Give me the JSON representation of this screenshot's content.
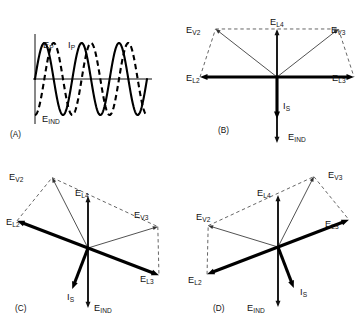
{
  "figure": {
    "width": 362,
    "height": 324,
    "background": "#ffffff",
    "ink": "#000000"
  },
  "panels": [
    {
      "id": "A",
      "tag": "(A)",
      "type": "waveform",
      "description": "Sinusoidal voltage and current waveforms with induced voltage",
      "labels": [
        {
          "base": "E",
          "sub": "P",
          "name": "primary-voltage"
        },
        {
          "base": "I",
          "sub": "P",
          "name": "primary-current"
        },
        {
          "base": "E",
          "sub": "IND",
          "name": "induced-voltage"
        }
      ],
      "waves": [
        {
          "name": "E_P",
          "style": "solid",
          "cycles": 3,
          "phase_deg": 0,
          "amplitude": 36
        },
        {
          "name": "I_P",
          "style": "dashed",
          "cycles": 3,
          "phase_deg": -90,
          "amplitude": 36
        }
      ]
    },
    {
      "id": "B",
      "tag": "(B)",
      "type": "phasor",
      "description": "Balanced phasor diagram, line voltages horizontal",
      "vectors": [
        {
          "label_base": "E",
          "label_sub": "L4",
          "angle_deg": 90,
          "weight": "medium",
          "name": "phasor-el4"
        },
        {
          "label_base": "E",
          "label_sub": "V2",
          "angle_deg": 142,
          "weight": "light",
          "name": "phasor-ev2"
        },
        {
          "label_base": "E",
          "label_sub": "V3",
          "angle_deg": 38,
          "weight": "light",
          "name": "phasor-ev3"
        },
        {
          "label_base": "E",
          "label_sub": "L2",
          "angle_deg": 180,
          "weight": "heavy",
          "name": "phasor-el2"
        },
        {
          "label_base": "E",
          "label_sub": "L3",
          "angle_deg": 0,
          "weight": "heavy",
          "name": "phasor-el3"
        },
        {
          "label_base": "I",
          "label_sub": "S",
          "angle_deg": 270,
          "weight": "heavy",
          "name": "phasor-is"
        },
        {
          "label_base": "E",
          "label_sub": "IND",
          "angle_deg": 270,
          "weight": "medium",
          "name": "phasor-eind"
        }
      ]
    },
    {
      "id": "C",
      "tag": "(C)",
      "type": "phasor",
      "description": "Phasor diagram rotated counterclockwise, E_L2 raised",
      "vectors": [
        {
          "label_base": "E",
          "label_sub": "L4",
          "angle_deg": 90,
          "weight": "medium",
          "name": "phasor-el4"
        },
        {
          "label_base": "E",
          "label_sub": "V2",
          "angle_deg": 117,
          "weight": "light",
          "name": "phasor-ev2"
        },
        {
          "label_base": "E",
          "label_sub": "V3",
          "angle_deg": 17,
          "weight": "light",
          "name": "phasor-ev3"
        },
        {
          "label_base": "E",
          "label_sub": "L2",
          "angle_deg": 159,
          "weight": "heavy",
          "name": "phasor-el2"
        },
        {
          "label_base": "E",
          "label_sub": "L3",
          "angle_deg": -21,
          "weight": "heavy",
          "name": "phasor-el3"
        },
        {
          "label_base": "I",
          "label_sub": "S",
          "angle_deg": 249,
          "weight": "heavy",
          "name": "phasor-is"
        },
        {
          "label_base": "E",
          "label_sub": "IND",
          "angle_deg": 270,
          "weight": "medium",
          "name": "phasor-eind"
        }
      ]
    },
    {
      "id": "D",
      "tag": "(D)",
      "type": "phasor",
      "description": "Phasor diagram rotated clockwise, E_L3 raised",
      "vectors": [
        {
          "label_base": "E",
          "label_sub": "L4",
          "angle_deg": 90,
          "weight": "medium",
          "name": "phasor-el4"
        },
        {
          "label_base": "E",
          "label_sub": "V2",
          "angle_deg": 163,
          "weight": "light",
          "name": "phasor-ev2"
        },
        {
          "label_base": "E",
          "label_sub": "V3",
          "angle_deg": 63,
          "weight": "light",
          "name": "phasor-ev3"
        },
        {
          "label_base": "E",
          "label_sub": "L2",
          "angle_deg": 201,
          "weight": "heavy",
          "name": "phasor-el2"
        },
        {
          "label_base": "E",
          "label_sub": "L3",
          "angle_deg": 21,
          "weight": "heavy",
          "name": "phasor-el3"
        },
        {
          "label_base": "I",
          "label_sub": "S",
          "angle_deg": 291,
          "weight": "heavy",
          "name": "phasor-is"
        },
        {
          "label_base": "E",
          "label_sub": "IND",
          "angle_deg": 270,
          "weight": "medium",
          "name": "phasor-eind"
        }
      ]
    }
  ]
}
